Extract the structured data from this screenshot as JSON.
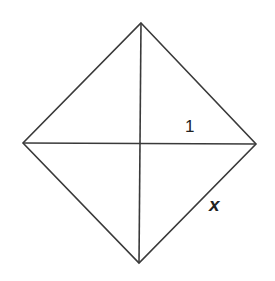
{
  "diagram": {
    "shape": "square rotated 45° (rhombus) with both diagonals",
    "stroke_color": "#3a3a3a",
    "vertices": {
      "top": [
        141,
        23
      ],
      "right": [
        256,
        144
      ],
      "bottom": [
        139,
        263
      ],
      "left": [
        23,
        143
      ]
    },
    "labels": {
      "half_diagonal": "1",
      "side": "x"
    }
  }
}
